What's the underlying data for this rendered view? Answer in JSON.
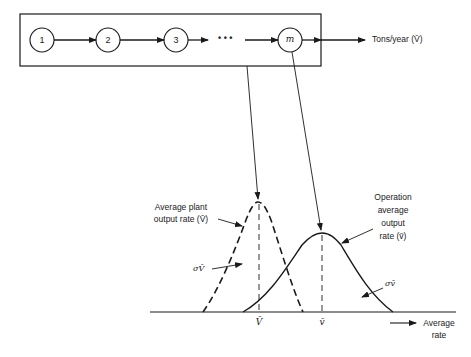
{
  "process_chain": {
    "nodes": [
      {
        "id": "1",
        "label": "1"
      },
      {
        "id": "2",
        "label": "2"
      },
      {
        "id": "3",
        "label": "3"
      },
      {
        "id": "m",
        "label": "m"
      }
    ],
    "ellipsis": "• • •",
    "output_label": "Tons/year (V̄)"
  },
  "distribution_plot": {
    "plant_curve": {
      "label_line1": "Average plant",
      "label_line2": "output rate (V̄)",
      "sigma_label": "σV̄",
      "style": "dashed"
    },
    "operation_curve": {
      "label_line1": "Operation",
      "label_line2": "average",
      "label_line3": "output",
      "label_line4": "rate (v̄)",
      "sigma_label": "σv̄",
      "style": "solid"
    },
    "axis": {
      "tick_plant_mean": "V̄",
      "tick_operation_mean": "v̄",
      "label_line1": "Average",
      "label_line2": "rate"
    }
  }
}
